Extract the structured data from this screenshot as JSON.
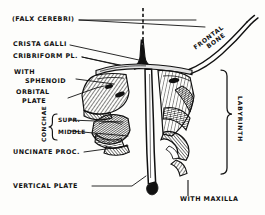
{
  "figure": {
    "background_color": "#fdfdfb",
    "ink_color": "#111111",
    "style": "line engraving with cross-hatch shading"
  },
  "labels": {
    "falx_cerebri": "(FALX CEREBRI)",
    "crista_galli": "CRISTA GALLI",
    "cribriform_plate": "CRIBRIFORM PL.",
    "with": "WITH",
    "sphenoid": "SPHENOID",
    "orbital": "ORBITAL",
    "plate": "PLATE",
    "conchae": "CONCHAE",
    "conchae_superior": "SUPR.",
    "conchae_middle": "MIDDLE",
    "uncinate_process": "UNCINATE PROC.",
    "vertical_plate": "VERTICAL PLATE",
    "frontal": "FRONTAL",
    "bone": "BONE",
    "labyrinth": "LABYRINTH",
    "with_maxilla": "WITH MAXILLA"
  },
  "leader_lines": {
    "count": 8,
    "description": "thin straight rules running from each left-hand caption to its structure"
  },
  "braces": {
    "conchae_brace": "{",
    "labyrinth_brace": "}"
  }
}
